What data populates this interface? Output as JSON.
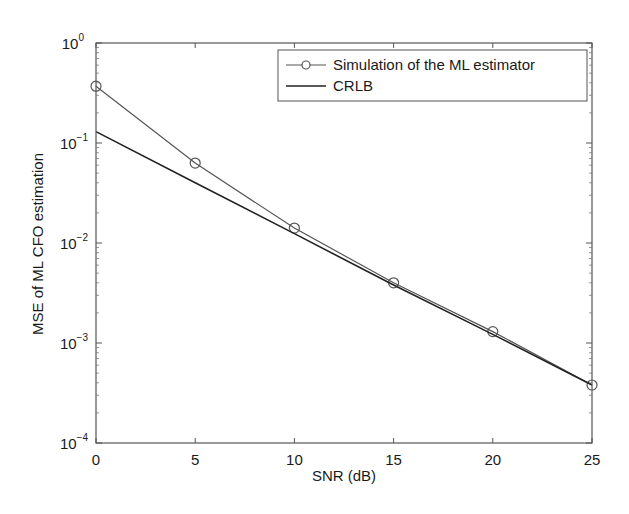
{
  "chart_data": {
    "type": "line",
    "title": "",
    "xlabel": "SNR (dB)",
    "ylabel": "MSE of ML CFO estimation",
    "xscale": "linear",
    "yscale": "log",
    "xlim": [
      0,
      25
    ],
    "ylim": [
      0.0001,
      1
    ],
    "x": [
      0,
      5,
      10,
      15,
      20,
      25
    ],
    "xticks": [
      0,
      5,
      10,
      15,
      20,
      25
    ],
    "yticks": [
      {
        "base": "10",
        "exp": "0",
        "value": 1
      },
      {
        "base": "10",
        "exp": "−1",
        "value": 0.1
      },
      {
        "base": "10",
        "exp": "−2",
        "value": 0.01
      },
      {
        "base": "10",
        "exp": "−3",
        "value": 0.001
      },
      {
        "base": "10",
        "exp": "−4",
        "value": 0.0001
      }
    ],
    "grid": false,
    "legend_position": "upper right",
    "series": [
      {
        "name": "Simulation of the ML estimator",
        "marker": "circle",
        "color": "#555555",
        "values": [
          0.37,
          0.063,
          0.0141,
          0.004,
          0.0013,
          0.00038
        ]
      },
      {
        "name": "CRLB",
        "marker": "none",
        "color": "#222222",
        "values": [
          0.13,
          0.04,
          0.0124,
          0.0038,
          0.00122,
          0.00038
        ]
      }
    ]
  }
}
